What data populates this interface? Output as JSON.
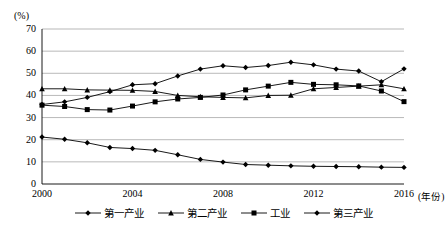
{
  "chart_data": {
    "type": "line",
    "title": "",
    "subtitle": "",
    "ylabel": "(%)",
    "xlabel": "(年份)",
    "ylim": [
      0,
      70
    ],
    "yticks": [
      0,
      10,
      20,
      30,
      40,
      50,
      60,
      70
    ],
    "xlim": [
      2000,
      2016
    ],
    "xticks": [
      2000,
      2004,
      2008,
      2012,
      2016
    ],
    "xtick_labels": [
      "2000",
      "2004",
      "2008",
      "2012",
      "2016"
    ],
    "grid": "horizontal",
    "legend_position": "bottom",
    "x": [
      2000,
      2001,
      2002,
      2003,
      2004,
      2005,
      2006,
      2007,
      2008,
      2009,
      2010,
      2011,
      2012,
      2013,
      2014,
      2015,
      2016
    ],
    "series": [
      {
        "name": "第一产业",
        "marker": "diamond",
        "color": "#000000",
        "values": [
          21.2,
          20.2,
          18.6,
          16.5,
          16.0,
          15.2,
          13.2,
          11.1,
          9.9,
          8.8,
          8.5,
          8.2,
          8.0,
          7.9,
          7.8,
          7.6,
          7.5
        ]
      },
      {
        "name": "第二产业",
        "marker": "triangle",
        "color": "#000000",
        "values": [
          43.0,
          43.0,
          42.5,
          42.4,
          42.3,
          41.8,
          40.0,
          39.4,
          39.1,
          38.9,
          40.0,
          40.1,
          43.0,
          43.6,
          44.2,
          44.8,
          43.0
        ]
      },
      {
        "name": "工业",
        "marker": "square",
        "color": "#000000",
        "values": [
          35.6,
          35.0,
          33.6,
          33.4,
          35.2,
          37.1,
          38.4,
          39.1,
          40.2,
          42.5,
          44.2,
          45.9,
          45.0,
          44.8,
          44.3,
          42.0,
          37.2
        ]
      },
      {
        "name": "第三产业",
        "marker": "diamond",
        "color": "#000000",
        "values": [
          35.9,
          37.1,
          39.1,
          41.7,
          44.8,
          45.3,
          48.8,
          51.9,
          53.4,
          52.6,
          53.5,
          55.0,
          53.8,
          51.9,
          51.0,
          46.2,
          52.0
        ]
      }
    ]
  }
}
